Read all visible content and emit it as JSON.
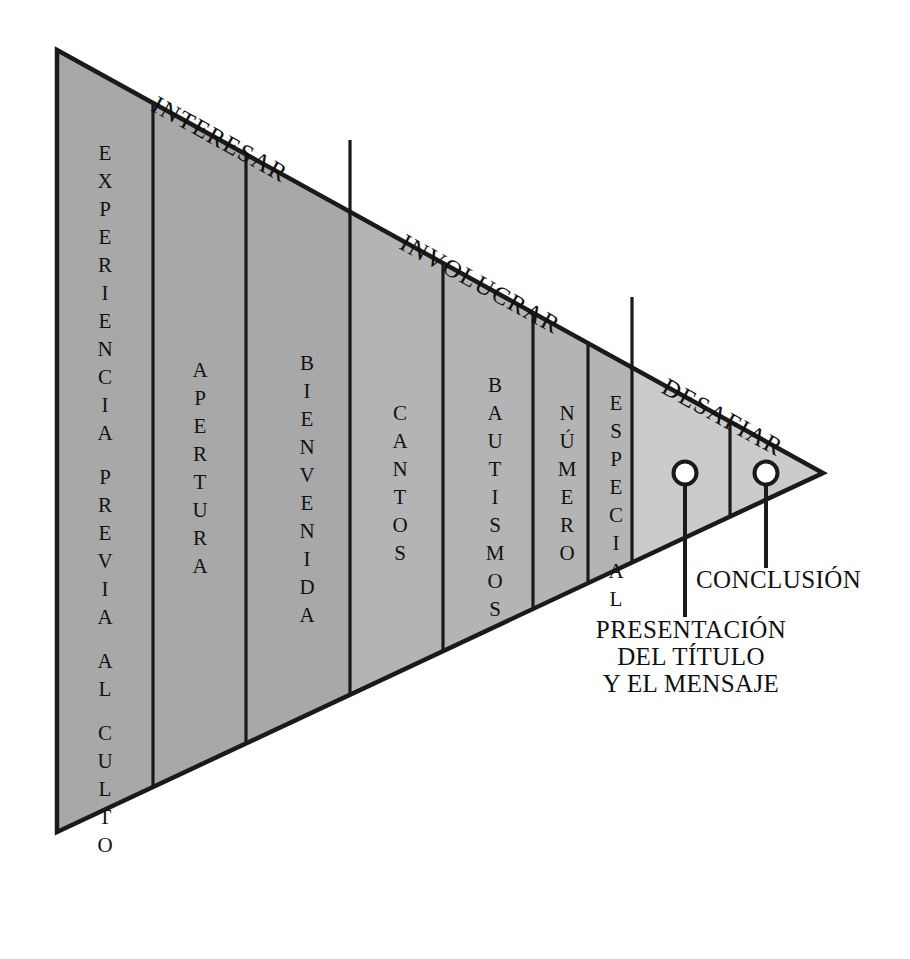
{
  "diagram": {
    "type": "funnel-triangle",
    "shape": {
      "apex_right": true,
      "vertices": "(57,50) (823,473) (57,832)"
    },
    "phases": [
      {
        "id": "interesar",
        "label": "INTERESAR",
        "fill": "#a8a8a8"
      },
      {
        "id": "involucrar",
        "label": "INVOLUCRAR",
        "fill": "#b4b4b4"
      },
      {
        "id": "desafiar",
        "label": "DESAFIAR",
        "fill": "#cbcbcb"
      }
    ],
    "segments": [
      {
        "id": "experiencia-previa-al-culto",
        "label": "EXPERIENCIA PREVIA AL CULTO",
        "phase": "interesar"
      },
      {
        "id": "apertura",
        "label": "APERTURA",
        "phase": "interesar"
      },
      {
        "id": "bienvenida",
        "label": "BIENVENIDA",
        "phase": "interesar"
      },
      {
        "id": "cantos",
        "label": "CANTOS",
        "phase": "involucrar"
      },
      {
        "id": "bautismos",
        "label": "BAUTISMOS",
        "phase": "involucrar"
      },
      {
        "id": "numero",
        "label": "NÚMERO",
        "phase": "involucrar"
      },
      {
        "id": "especial",
        "label": "ESPECIAL",
        "phase": "involucrar"
      },
      {
        "id": "presentacion",
        "label": "",
        "phase": "desafiar"
      },
      {
        "id": "conclusion",
        "label": "",
        "phase": "desafiar"
      }
    ],
    "callouts": [
      {
        "id": "presentacion-del-titulo-y-el-mensaje",
        "lines": [
          "PRESENTACIÓN",
          "DEL TÍTULO",
          "Y EL MENSAJE"
        ],
        "marker": "circle"
      },
      {
        "id": "conclusion",
        "lines": [
          "CONCLUSIÓN"
        ],
        "marker": "circle"
      }
    ],
    "colors": {
      "stroke": "#1a1a1a",
      "background": "#ffffff",
      "fill_dark": "#a8a8a8",
      "fill_mid": "#b4b4b4",
      "fill_light": "#cbcbcb"
    }
  }
}
